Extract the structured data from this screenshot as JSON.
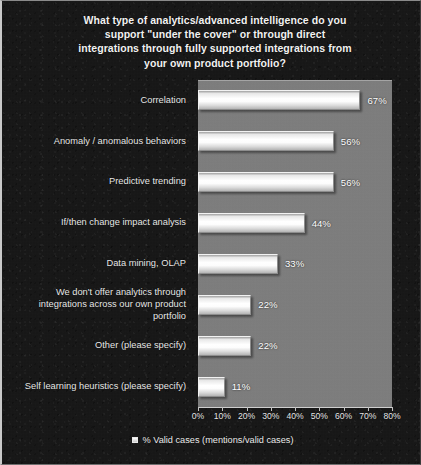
{
  "chart_data": {
    "type": "bar",
    "orientation": "horizontal",
    "title": "What type of analytics/advanced intelligence do you support \"under the cover\" or through direct integrations through fully supported integrations from your own product portfolio?",
    "title_lines": [
      "What type of analytics/advanced intelligence do you",
      "support \"under the cover\" or through direct",
      "integrations through fully supported integrations from",
      "your own product portfolio?"
    ],
    "categories": [
      "Correlation",
      "Anomaly / anomalous behaviors",
      "Predictive trending",
      "If/then change impact analysis",
      "Data mining, OLAP",
      "We don't offer analytics through integrations across our own product portfolio",
      "Other (please specify)",
      "Self learning heuristics (please specify)"
    ],
    "category_lines": [
      [
        "Correlation"
      ],
      [
        "Anomaly / anomalous behaviors"
      ],
      [
        "Predictive trending"
      ],
      [
        "If/then change impact analysis"
      ],
      [
        "Data mining, OLAP"
      ],
      [
        "We don't offer analytics through",
        "integrations across our own product",
        "portfolio"
      ],
      [
        "Other (please specify)"
      ],
      [
        "Self learning heuristics (please specify)"
      ]
    ],
    "values": [
      67,
      56,
      56,
      44,
      33,
      22,
      22,
      11
    ],
    "value_labels": [
      "67%",
      "56%",
      "56%",
      "44%",
      "33%",
      "22%",
      "22%",
      "11%"
    ],
    "xlabel": "",
    "ylabel": "",
    "xlim": [
      0,
      80
    ],
    "xticks": [
      0,
      10,
      20,
      30,
      40,
      50,
      60,
      70,
      80
    ],
    "xtick_labels": [
      "0%",
      "10%",
      "20%",
      "30%",
      "40%",
      "50%",
      "60%",
      "70%",
      "80%"
    ],
    "grid": false,
    "legend": {
      "position": "bottom",
      "entries": [
        "% Valid cases (mentions/valid cases)"
      ]
    },
    "colors": {
      "background": "#151515",
      "plot_background": "#7e7e7e",
      "bar_fill": "#ffffff",
      "text": "#eeeeee",
      "axis": "#cfcfcf"
    }
  }
}
